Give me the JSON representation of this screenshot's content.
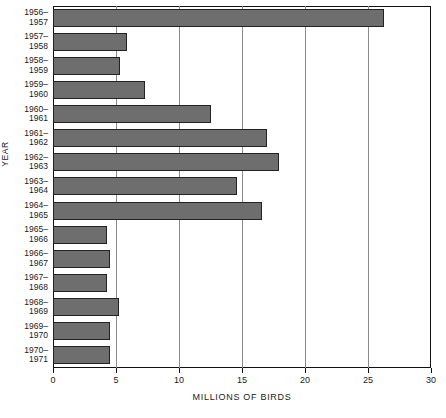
{
  "chart_data": {
    "type": "bar",
    "orientation": "horizontal",
    "title": "",
    "xlabel": "MILLIONS OF BIRDS",
    "ylabel": "YEAR",
    "xlim": [
      0,
      30
    ],
    "xticks": [
      0,
      5,
      10,
      15,
      20,
      25,
      30
    ],
    "grid": true,
    "legend": "none",
    "categories": [
      "1956–1957",
      "1957–1958",
      "1958–1959",
      "1959–1960",
      "1960–1961",
      "1961–1962",
      "1962–1963",
      "1963–1964",
      "1964–1965",
      "1965–1966",
      "1966–1967",
      "1967–1968",
      "1968–1969",
      "1969–1970",
      "1970–1971"
    ],
    "category_lines": [
      [
        "1956–",
        "1957"
      ],
      [
        "1957–",
        "1958"
      ],
      [
        "1958–",
        "1959"
      ],
      [
        "1959–",
        "1960"
      ],
      [
        "1960–",
        "1961"
      ],
      [
        "1961–",
        "1962"
      ],
      [
        "1962–",
        "1963"
      ],
      [
        "1963–",
        "1964"
      ],
      [
        "1964–",
        "1965"
      ],
      [
        "1965–",
        "1966"
      ],
      [
        "1966–",
        "1967"
      ],
      [
        "1967–",
        "1968"
      ],
      [
        "1968–",
        "1969"
      ],
      [
        "1969–",
        "1970"
      ],
      [
        "1970–",
        "1971"
      ]
    ],
    "values": [
      26.3,
      5.9,
      5.3,
      7.3,
      12.5,
      17.0,
      17.9,
      14.6,
      16.6,
      4.3,
      4.5,
      4.3,
      5.2,
      4.5,
      4.5
    ],
    "bar_color": "#6e6e6e",
    "bar_edge_color": "#222222",
    "grid_color": "#8a8a8a",
    "axis_color": "#111111"
  }
}
